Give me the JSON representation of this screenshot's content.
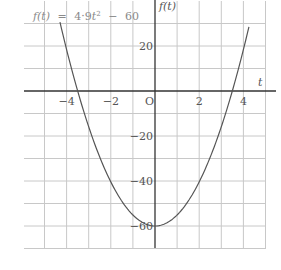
{
  "chart_data": {
    "type": "line",
    "title_parts": {
      "lhs": "f(t)",
      "eq": "=",
      "coef": "4·9",
      "var": "t",
      "exp": "2",
      "minus": "−",
      "const": "60"
    },
    "xlabel": "t",
    "ylabel": "f(t)",
    "origin_label": "O",
    "xlim": [
      -6,
      5
    ],
    "ylim": [
      -70,
      40
    ],
    "grid": true,
    "x_grid_step": 1,
    "y_grid_step": 10,
    "x_ticks": [
      {
        "value": -4,
        "label": "−4"
      },
      {
        "value": -2,
        "label": "−2"
      },
      {
        "value": 2,
        "label": "2"
      },
      {
        "value": 4,
        "label": "4"
      }
    ],
    "y_ticks": [
      {
        "value": 20,
        "label": "20"
      },
      {
        "value": -20,
        "label": "−20"
      },
      {
        "value": -40,
        "label": "−40"
      },
      {
        "value": -60,
        "label": "−60"
      }
    ],
    "series": [
      {
        "name": "f(t) = 4.9t^2 - 60",
        "function": {
          "a": 4.9,
          "b": 0,
          "c": -60
        },
        "t_range": [
          -4.3,
          4.25
        ],
        "x": [
          -4.3,
          -4,
          -3.5,
          -3,
          -2,
          -1,
          0,
          1,
          2,
          3,
          3.5,
          4,
          4.25
        ],
        "values": [
          30.6,
          18.4,
          0.0,
          -15.9,
          -40.4,
          -55.1,
          -60,
          -55.1,
          -40.4,
          -15.9,
          0.0,
          18.4,
          28.5
        ],
        "color": "#555555"
      }
    ],
    "key_points": {
      "vertex": [
        0,
        -60
      ],
      "roots": [
        -3.5,
        3.5
      ]
    }
  },
  "colors": {
    "grid": "#c8c8c8",
    "axis": "#333333",
    "curve": "#555555",
    "title": "#8a8a8a"
  }
}
